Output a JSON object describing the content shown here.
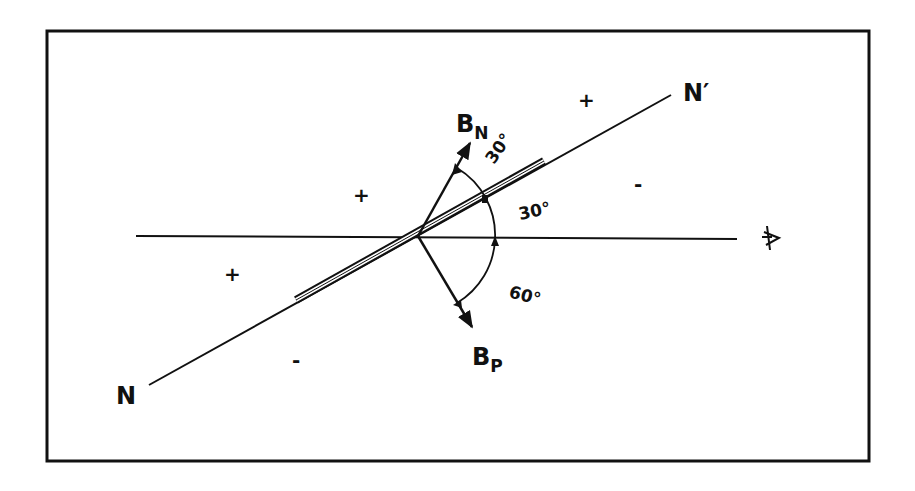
{
  "diagram": {
    "labels": {
      "n_end": "N",
      "n_prime_end": "N′",
      "b_n_main": "B",
      "b_n_sub": "N",
      "b_p_main": "B",
      "b_p_sub": "P"
    },
    "angles": {
      "bn_to_axis": "30°",
      "axis_to_horizontal": "30°",
      "horizontal_to_bp": "60°"
    },
    "signs": {
      "upper_right": "+",
      "upper_left": "+",
      "right": "-",
      "left": "+",
      "lower": "-"
    },
    "observer_icon": "eye-icon",
    "colors": {
      "ink": "#111111",
      "background": "#ffffff"
    }
  }
}
